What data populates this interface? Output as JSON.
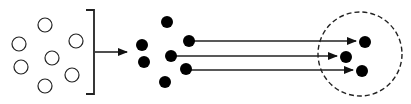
{
  "diagram": {
    "width": 411,
    "height": 104,
    "colors": {
      "background": "#ffffff",
      "stroke": "#222222",
      "fill": "#000000"
    },
    "open_circles": [
      {
        "cx": 45,
        "cy": 25,
        "r": 7
      },
      {
        "cx": 19,
        "cy": 44,
        "r": 7
      },
      {
        "cx": 76,
        "cy": 41,
        "r": 7
      },
      {
        "cx": 21,
        "cy": 67,
        "r": 7
      },
      {
        "cx": 52,
        "cy": 58,
        "r": 7
      },
      {
        "cx": 72,
        "cy": 75,
        "r": 7
      },
      {
        "cx": 45,
        "cy": 86,
        "r": 7
      }
    ],
    "bracket": {
      "x": 94,
      "top": 10,
      "bottom": 94,
      "tick": 8
    },
    "entry_arrow": {
      "x1": 95,
      "y1": 52,
      "x2": 127,
      "y2": 52
    },
    "filled_dots": [
      {
        "cx": 167,
        "cy": 22,
        "r": 6
      },
      {
        "cx": 142,
        "cy": 45,
        "r": 6
      },
      {
        "cx": 189,
        "cy": 41,
        "r": 6
      },
      {
        "cx": 144,
        "cy": 62,
        "r": 6
      },
      {
        "cx": 171,
        "cy": 56,
        "r": 6
      },
      {
        "cx": 186,
        "cy": 69,
        "r": 6
      },
      {
        "cx": 165,
        "cy": 82,
        "r": 6
      }
    ],
    "transfer_arrows": [
      {
        "x1": 189,
        "y1": 41,
        "x2": 356,
        "y2": 41
      },
      {
        "x1": 171,
        "y1": 56,
        "x2": 337,
        "y2": 56
      },
      {
        "x1": 186,
        "y1": 70,
        "x2": 353,
        "y2": 70
      }
    ],
    "target_region": {
      "cx": 360,
      "cy": 54,
      "r": 42,
      "dash": "5 3"
    },
    "target_dots": [
      {
        "cx": 365,
        "cy": 42,
        "r": 6
      },
      {
        "cx": 346,
        "cy": 57,
        "r": 6
      },
      {
        "cx": 362,
        "cy": 71,
        "r": 6
      }
    ]
  }
}
